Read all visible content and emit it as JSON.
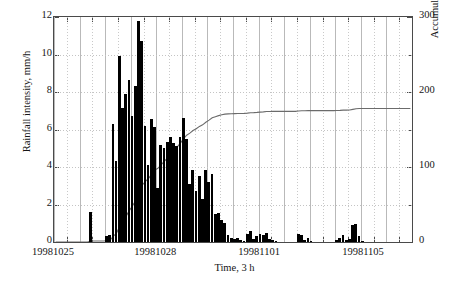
{
  "chart_data": {
    "type": "bar",
    "title": "",
    "xlabel": "Time, 3 h",
    "ylabel": "Rainfall intensity, mm/h",
    "y2label": "Accumulated rainfall, mm",
    "ylim": [
      0,
      12
    ],
    "y2lim": [
      0,
      300
    ],
    "yticks": [
      0,
      2,
      4,
      6,
      8,
      10,
      12
    ],
    "ytick_labels": [
      "0",
      "2",
      "4",
      "6",
      "8",
      "10",
      "12"
    ],
    "y2ticks": [
      0,
      100,
      200,
      300
    ],
    "y2tick_labels": [
      "0",
      "100",
      "200",
      "300"
    ],
    "y2_minor_ticks": [
      50,
      150,
      250
    ],
    "xtick_positions": [
      0,
      32,
      64.5,
      97
    ],
    "xtick_labels": [
      "19981025",
      "19981028",
      "19981101",
      "19981105"
    ],
    "grid": "both-dotted-minor-solid-major",
    "legend": "none",
    "bar_series_name": "Rainfall intensity",
    "line_series_name": "Accumulated rainfall",
    "line_color": "#6b6b6b",
    "bar_color": "#000000",
    "n_bars": 112,
    "bar_interval_hours": 3,
    "values": [
      0,
      0,
      0,
      0,
      0,
      0,
      0,
      0,
      0,
      0,
      0,
      1.6,
      0,
      0,
      0,
      0,
      0.3,
      0.35,
      6.3,
      4.3,
      9.9,
      7.15,
      7.9,
      8.65,
      6.7,
      8.3,
      11.8,
      10.7,
      6.2,
      4.1,
      6.55,
      6.15,
      2.9,
      5.2,
      5.0,
      5.35,
      5.6,
      5.3,
      5.1,
      5.6,
      6.6,
      5.5,
      3.1,
      3.85,
      2.7,
      3.5,
      2.3,
      3.85,
      3.2,
      3.65,
      1.5,
      1.55,
      1.2,
      1.0,
      0.35,
      0.2,
      0.15,
      0.2,
      0.1,
      0.05,
      0.45,
      0.6,
      0.15,
      0.3,
      0.45,
      0.35,
      0.5,
      0.15,
      0.1,
      0.05,
      0,
      0,
      0,
      0,
      0,
      0,
      0.45,
      0.35,
      0.1,
      0.2,
      0.05,
      0,
      0,
      0,
      0,
      0,
      0,
      0,
      0.1,
      0.2,
      0.35,
      0.1,
      0.15,
      0.9,
      0.95,
      0.3,
      0.05,
      0,
      0,
      0,
      0,
      0,
      0,
      0,
      0,
      0,
      0,
      0,
      0,
      0,
      0,
      0
    ],
    "accumulated_mm": [
      0,
      0,
      0,
      0,
      0,
      0,
      0,
      0,
      0,
      0,
      0,
      4.8,
      4.8,
      4.8,
      4.8,
      4.8,
      5.7,
      6.8,
      25.7,
      38.6,
      68.3,
      89.8,
      113.5,
      139.5,
      159.6,
      184.5,
      219.9,
      252.0,
      270.6,
      282.9,
      302.6,
      321.1,
      329.8,
      345.4,
      360.4,
      376.5,
      393.3,
      409.2,
      424.5,
      441.3,
      461.1,
      477.6,
      486.9,
      498.5,
      506.6,
      517.1,
      524.0,
      535.6,
      545.2,
      556.1,
      560.6,
      565.3,
      568.9,
      571.9,
      573.0,
      573.6,
      574.1,
      574.7,
      575.0,
      575.2,
      576.5,
      578.3,
      578.8,
      579.7,
      581.0,
      582.1,
      583.6,
      584.0,
      584.3,
      584.5,
      584.5,
      584.5,
      584.5,
      584.5,
      584.5,
      584.5,
      585.8,
      586.9,
      587.2,
      587.8,
      587.9,
      587.9,
      587.9,
      587.9,
      587.9,
      587.9,
      587.9,
      587.9,
      588.2,
      588.8,
      589.8,
      590.1,
      590.6,
      593.3,
      596.1,
      597.0,
      597.2,
      597.2,
      597.2,
      597.2,
      597.2,
      597.2,
      597.2,
      597.2,
      597.2,
      597.2,
      597.2,
      597.2,
      597.2,
      597.2,
      597.2,
      597.2
    ],
    "accumulated_final_mm": 178,
    "note": "accumulated series plotted on right axis, rises through storm then plateaus near 178 mm"
  }
}
